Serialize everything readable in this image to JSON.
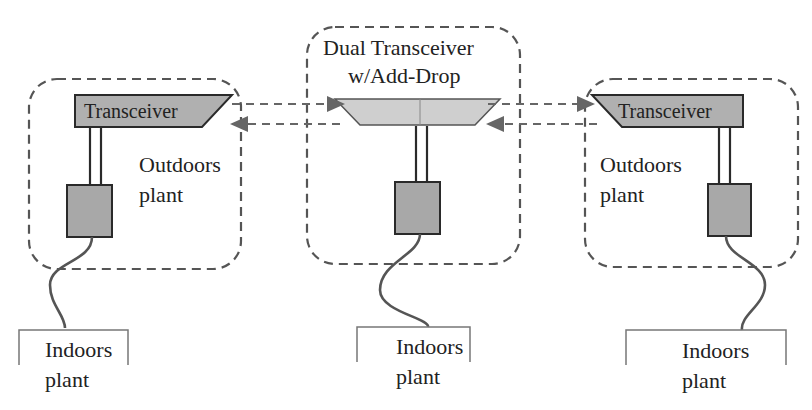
{
  "diagram": {
    "nodes": {
      "left": {
        "transceiver_label": "Transceiver",
        "outdoor_label_line1": "Outdoors",
        "outdoor_label_line2": "plant",
        "indoor_label_line1": "Indoors",
        "indoor_label_line2": "plant"
      },
      "center": {
        "title_line1": "Dual Transceiver",
        "title_line2": "w/Add-Drop",
        "indoor_label_line1": "Indoors",
        "indoor_label_line2": "plant"
      },
      "right": {
        "transceiver_label": "Transceiver",
        "outdoor_label_line1": "Outdoors",
        "outdoor_label_line2": "plant",
        "indoor_label_line1": "Indoors",
        "indoor_label_line2": "plant"
      }
    },
    "links": [
      {
        "from": "left-transceiver",
        "to": "center-add-drop",
        "direction": "right",
        "style": "dashed"
      },
      {
        "from": "center-add-drop",
        "to": "left-transceiver",
        "direction": "left",
        "style": "dashed"
      },
      {
        "from": "center-add-drop",
        "to": "right-transceiver",
        "direction": "right",
        "style": "dashed"
      },
      {
        "from": "right-transceiver",
        "to": "center-add-drop",
        "direction": "left",
        "style": "dashed"
      }
    ],
    "colors": {
      "transceiver_fill": "#b0b0b0",
      "add_drop_fill": "#cfcfcf",
      "unit_fill": "#a8a8a8",
      "line": "#2a2a2a",
      "dashed": "#555555"
    }
  }
}
